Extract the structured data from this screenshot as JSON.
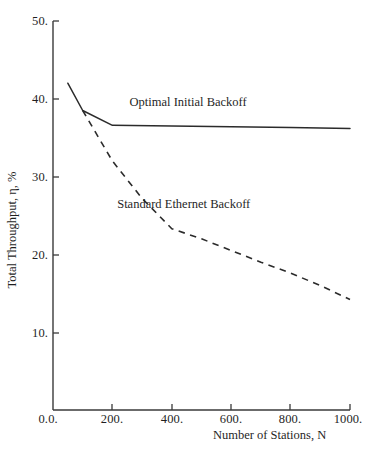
{
  "chart_data": {
    "type": "line",
    "title": "",
    "subtitle": "",
    "xlabel": "Number of Stations, N",
    "ylabel": "Total Throughput, η, %",
    "xlim": [
      0,
      1000
    ],
    "ylim": [
      0,
      50
    ],
    "grid": false,
    "legend_position": "inline-annotation",
    "xticks": [
      0,
      200,
      400,
      600,
      800,
      1000
    ],
    "xtick_labels": [
      "0.",
      "200.",
      "400.",
      "600.",
      "800.",
      "1000."
    ],
    "yticks": [
      0,
      10,
      20,
      30,
      40,
      50
    ],
    "ytick_labels": [
      "0.",
      "10.",
      "20.",
      "30.",
      "40.",
      "50."
    ],
    "series": [
      {
        "name": "Optimal Initial Backoff",
        "style": "solid",
        "color": "#2b2b2b",
        "x": [
          50,
          100,
          200,
          400,
          600,
          800,
          1000
        ],
        "values": [
          42.0,
          38.5,
          36.6,
          36.5,
          36.4,
          36.3,
          36.2
        ]
      },
      {
        "name": "Standard Ethernet Backoff",
        "style": "dashed",
        "color": "#2b2b2b",
        "x": [
          100,
          200,
          300,
          400,
          500,
          600,
          700,
          800,
          900,
          1000
        ],
        "values": [
          38.5,
          32.0,
          27.2,
          23.3,
          22.0,
          20.5,
          19.0,
          17.6,
          16.0,
          14.2
        ]
      }
    ],
    "annotations": [
      {
        "text": "Optimal Initial Backoff",
        "x": 455,
        "y": 39.5
      },
      {
        "text": "Standard Ethernet Backoff",
        "x": 440,
        "y": 26.3
      }
    ]
  },
  "axes": {
    "x_axis_name": "x-axis",
    "y_axis_name": "y-axis"
  }
}
